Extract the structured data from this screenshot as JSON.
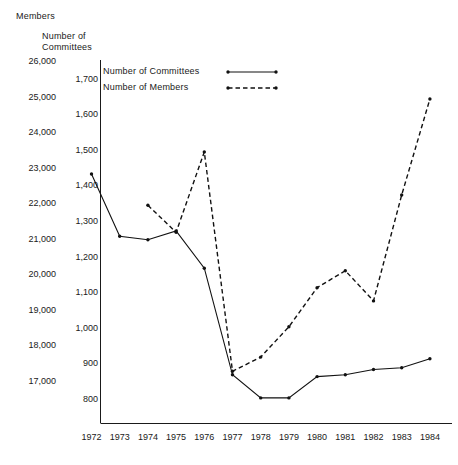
{
  "chart_data": {
    "type": "line",
    "title": "",
    "x": [
      1972,
      1973,
      1974,
      1975,
      1976,
      1977,
      1978,
      1979,
      1980,
      1981,
      1982,
      1983,
      1984
    ],
    "xlabel": "",
    "xtick_labels": [
      "1972",
      "1973",
      "1974",
      "1975",
      "1976",
      "1977",
      "1978",
      "1979",
      "1980",
      "1981",
      "1982",
      "1983",
      "1984"
    ],
    "grid": false,
    "legend_position": "top-center",
    "axes": [
      {
        "id": "members",
        "name": "Members",
        "side": "left",
        "ylim": [
          16000,
          26000
        ],
        "ticks": [
          26000,
          25000,
          24000,
          23000,
          22000,
          21000,
          20000,
          19000,
          18000,
          17000
        ],
        "tick_labels": [
          "26,000",
          "25,000",
          "24,000",
          "23,000",
          "22,000",
          "21,000",
          "20,000",
          "19,000",
          "18,000",
          "17,000"
        ]
      },
      {
        "id": "committees",
        "name": "Number of\nCommittees",
        "name_line1": "Number of",
        "name_line2": "Committees",
        "side": "left-inner",
        "ylim": [
          700,
          1700
        ],
        "ticks": [
          1700,
          1600,
          1500,
          1400,
          1300,
          1200,
          1100,
          1000,
          900,
          800
        ],
        "tick_labels": [
          "1,700",
          "1,600",
          "1,500",
          "1,400",
          "1,300",
          "1,200",
          "1,100",
          "1,000",
          "900",
          "800"
        ]
      }
    ],
    "series": [
      {
        "name": "Number of Committees",
        "axis": "committees",
        "style": "solid",
        "marker": "dot",
        "color": "#111111",
        "x": [
          1972,
          1973,
          1974,
          1975,
          1976,
          1977,
          1978,
          1979,
          1980,
          1981,
          1982,
          1983,
          1984
        ],
        "values": [
          1435,
          1260,
          1250,
          1275,
          1170,
          870,
          805,
          805,
          865,
          870,
          885,
          890,
          915
        ]
      },
      {
        "name": "Number of Members",
        "axis": "members",
        "style": "dashed",
        "marker": "dot",
        "color": "#111111",
        "x": [
          1974,
          1975,
          1976,
          1977,
          1978,
          1979,
          1980,
          1981,
          1982,
          1983,
          1984
        ],
        "values": [
          21970,
          21210,
          23470,
          17300,
          17700,
          18550,
          19650,
          20130,
          19280,
          22260,
          24960
        ]
      }
    ],
    "legend": [
      {
        "label": "Number of Committees",
        "style": "solid"
      },
      {
        "label": "Number of Members",
        "style": "dashed"
      }
    ]
  }
}
